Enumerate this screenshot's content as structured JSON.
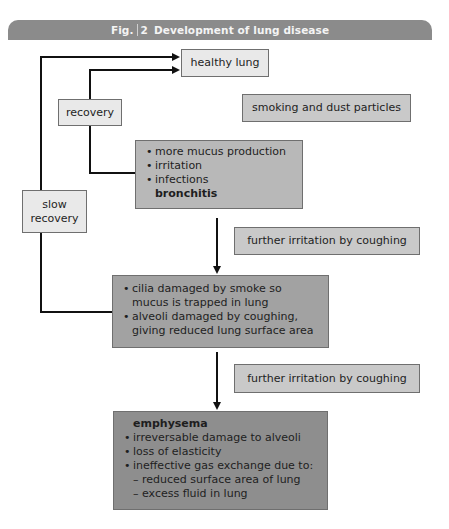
{
  "header": {
    "fig_label": "Fig.",
    "fig_number": "2",
    "title": "Development of lung disease"
  },
  "nodes": {
    "healthy_lung": "healthy lung",
    "smoking": "smoking and dust particles",
    "recovery": "recovery",
    "slow_recovery_line1": "slow",
    "slow_recovery_line2": "recovery",
    "bronchitis": {
      "items": [
        "more mucus production",
        "irritation",
        "infections"
      ],
      "title": "bronchitis"
    },
    "further_irritation_1": "further irritation by coughing",
    "cilia": {
      "items": [
        "cilia damaged by smoke so mucus is trapped in lung",
        "alveoli damaged by coughing, giving reduced lung surface area"
      ]
    },
    "further_irritation_2": "further irritation by coughing",
    "emphysema": {
      "title": "emphysema",
      "items": [
        "irreversable damage to alveoli",
        "loss of elasticity",
        "ineffective gas exchange due to:"
      ],
      "subitems": [
        "– reduced surface area of lung",
        "– excess fluid in lung"
      ]
    }
  },
  "colors": {
    "header": "#8b8b8b",
    "healthy_lung": "#e9e9e9",
    "smoking": "#c9c9c9",
    "bronchitis": "#b8b8b8",
    "cilia": "#a2a2a2",
    "emphysema": "#8e8e8e"
  }
}
